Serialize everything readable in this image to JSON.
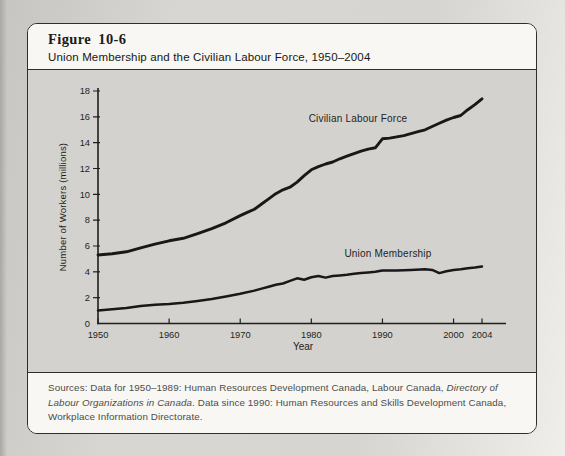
{
  "figure": {
    "label": "Figure 10-6",
    "title": "Union Membership and the Civilian Labour Force, 1950–2004"
  },
  "sources": {
    "part1": "Sources: Data for 1950–1989: Human Resources Development Canada, Labour Canada, ",
    "italic": "Directory of Labour Organizations in Canada",
    "part2": ". Data since 1990: Human Resources and Skills Development Canada, Workplace Information Directorate."
  },
  "colors": {
    "line": "#181818",
    "axis": "#1f1f1d",
    "chart_panel_bg": "#d3d2ce",
    "panel_bg": "#f8f7f3",
    "border": "#2e2e2c"
  },
  "chart_data": {
    "type": "line",
    "title": "Union Membership and the Civilian Labour Force, 1950–2004",
    "xlabel": "Year",
    "ylabel": "Number of Workers (millions)",
    "xlim": [
      1950,
      2004
    ],
    "ylim": [
      0,
      18
    ],
    "yticks": [
      0,
      2,
      4,
      6,
      8,
      10,
      12,
      14,
      16,
      18
    ],
    "xticks": [
      1950,
      1960,
      1970,
      1980,
      1990,
      2000,
      2004
    ],
    "grid": false,
    "legend_position": "inline-labels",
    "series": [
      {
        "name": "Civilian Labour Force",
        "points": [
          [
            1950,
            5.3
          ],
          [
            1952,
            5.4
          ],
          [
            1954,
            5.55
          ],
          [
            1956,
            5.85
          ],
          [
            1958,
            6.15
          ],
          [
            1960,
            6.4
          ],
          [
            1962,
            6.6
          ],
          [
            1964,
            6.95
          ],
          [
            1966,
            7.35
          ],
          [
            1968,
            7.8
          ],
          [
            1970,
            8.35
          ],
          [
            1971,
            8.6
          ],
          [
            1972,
            8.85
          ],
          [
            1973,
            9.25
          ],
          [
            1974,
            9.65
          ],
          [
            1975,
            10.05
          ],
          [
            1976,
            10.35
          ],
          [
            1977,
            10.55
          ],
          [
            1978,
            10.95
          ],
          [
            1979,
            11.45
          ],
          [
            1980,
            11.9
          ],
          [
            1981,
            12.15
          ],
          [
            1982,
            12.35
          ],
          [
            1983,
            12.5
          ],
          [
            1984,
            12.75
          ],
          [
            1985,
            12.95
          ],
          [
            1986,
            13.15
          ],
          [
            1987,
            13.35
          ],
          [
            1988,
            13.5
          ],
          [
            1989,
            13.6
          ],
          [
            1990,
            14.3
          ],
          [
            1991,
            14.35
          ],
          [
            1992,
            14.45
          ],
          [
            1993,
            14.55
          ],
          [
            1994,
            14.7
          ],
          [
            1995,
            14.85
          ],
          [
            1996,
            15.0
          ],
          [
            1997,
            15.25
          ],
          [
            1998,
            15.5
          ],
          [
            1999,
            15.75
          ],
          [
            2000,
            15.95
          ],
          [
            2001,
            16.1
          ],
          [
            2002,
            16.55
          ],
          [
            2003,
            16.95
          ],
          [
            2004,
            17.4
          ]
        ]
      },
      {
        "name": "Union Membership",
        "points": [
          [
            1950,
            1.0
          ],
          [
            1952,
            1.1
          ],
          [
            1954,
            1.2
          ],
          [
            1956,
            1.35
          ],
          [
            1958,
            1.45
          ],
          [
            1960,
            1.5
          ],
          [
            1962,
            1.6
          ],
          [
            1964,
            1.75
          ],
          [
            1966,
            1.9
          ],
          [
            1968,
            2.1
          ],
          [
            1970,
            2.3
          ],
          [
            1972,
            2.55
          ],
          [
            1973,
            2.7
          ],
          [
            1974,
            2.85
          ],
          [
            1975,
            3.0
          ],
          [
            1976,
            3.1
          ],
          [
            1977,
            3.3
          ],
          [
            1978,
            3.5
          ],
          [
            1979,
            3.38
          ],
          [
            1980,
            3.58
          ],
          [
            1981,
            3.68
          ],
          [
            1982,
            3.55
          ],
          [
            1983,
            3.68
          ],
          [
            1984,
            3.72
          ],
          [
            1985,
            3.78
          ],
          [
            1986,
            3.85
          ],
          [
            1987,
            3.9
          ],
          [
            1988,
            3.95
          ],
          [
            1989,
            4.0
          ],
          [
            1990,
            4.1
          ],
          [
            1992,
            4.1
          ],
          [
            1994,
            4.15
          ],
          [
            1996,
            4.2
          ],
          [
            1997,
            4.15
          ],
          [
            1998,
            3.9
          ],
          [
            1999,
            4.05
          ],
          [
            2000,
            4.15
          ],
          [
            2001,
            4.2
          ],
          [
            2002,
            4.28
          ],
          [
            2003,
            4.33
          ],
          [
            2004,
            4.42
          ]
        ]
      }
    ]
  }
}
